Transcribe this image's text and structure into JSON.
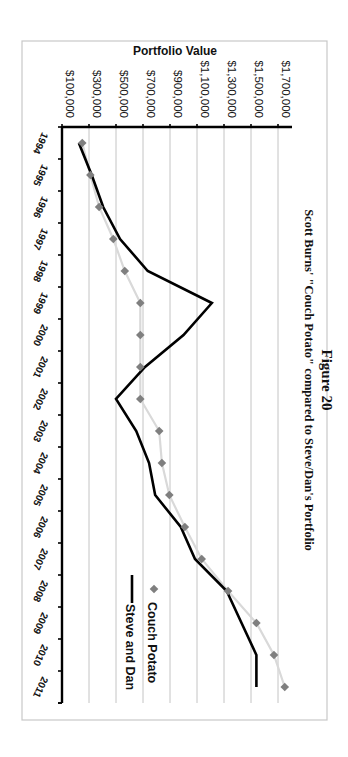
{
  "figure": {
    "title_line1": "Figure 20",
    "title_line2": "Scott Burns' \"Couch Potato\" compared to Steve/Dan's Portfolio"
  },
  "axes": {
    "value_axis_title": "Portfolio Value",
    "value_ticks": [
      "$100,000",
      "$300,000",
      "$500,000",
      "$700,000",
      "$900,000",
      "$1,100,000",
      "$1,300,000",
      "$1,500,000",
      "$1,700,000"
    ],
    "categories": [
      "1994",
      "1995",
      "1996",
      "1997",
      "1998",
      "1999",
      "2000",
      "2001",
      "2002",
      "2003",
      "2004",
      "2005",
      "2006",
      "2007",
      "2008",
      "2009",
      "2010",
      "2011"
    ]
  },
  "legend": {
    "items": [
      {
        "label": "Couch Potato",
        "marker": "diamond",
        "color": "#7f7f7f"
      },
      {
        "label": "Steve and Dan",
        "marker": "line",
        "color": "#000000"
      }
    ]
  },
  "colors": {
    "couch_potato_marker": "#7f7f7f",
    "couch_potato_line": "#d9d9d9",
    "steve_dan_line": "#000000",
    "grid": "#bdbdbd"
  },
  "chart_data": {
    "type": "line",
    "orientation": "rotated 90° clockwise on page (value axis across top, years down left side)",
    "xlabel": "",
    "ylabel": "Portfolio Value",
    "ylim": [
      100000,
      1800000
    ],
    "yticks": [
      100000,
      300000,
      500000,
      700000,
      900000,
      1100000,
      1300000,
      1500000,
      1700000
    ],
    "grid": true,
    "legend_position": "right (rotated)",
    "categories": [
      "1994",
      "1995",
      "1996",
      "1997",
      "1998",
      "1999",
      "2000",
      "2001",
      "2002",
      "2003",
      "2004",
      "2005",
      "2006",
      "2007",
      "2008",
      "2009",
      "2010",
      "2011"
    ],
    "series": [
      {
        "name": "Couch Potato",
        "style": "gray diamond markers with light gray connecting line",
        "values": [
          250000,
          310000,
          375000,
          480000,
          565000,
          680000,
          680000,
          680000,
          680000,
          820000,
          840000,
          895000,
          1010000,
          1135000,
          1330000,
          1540000,
          1670000,
          1750000
        ]
      },
      {
        "name": "Steve and Dan",
        "style": "solid black line",
        "values": [
          225000,
          320000,
          405000,
          530000,
          735000,
          1210000,
          1000000,
          715000,
          500000,
          650000,
          745000,
          790000,
          980000,
          1085000,
          1320000,
          1430000,
          1540000,
          1540000
        ]
      }
    ]
  }
}
